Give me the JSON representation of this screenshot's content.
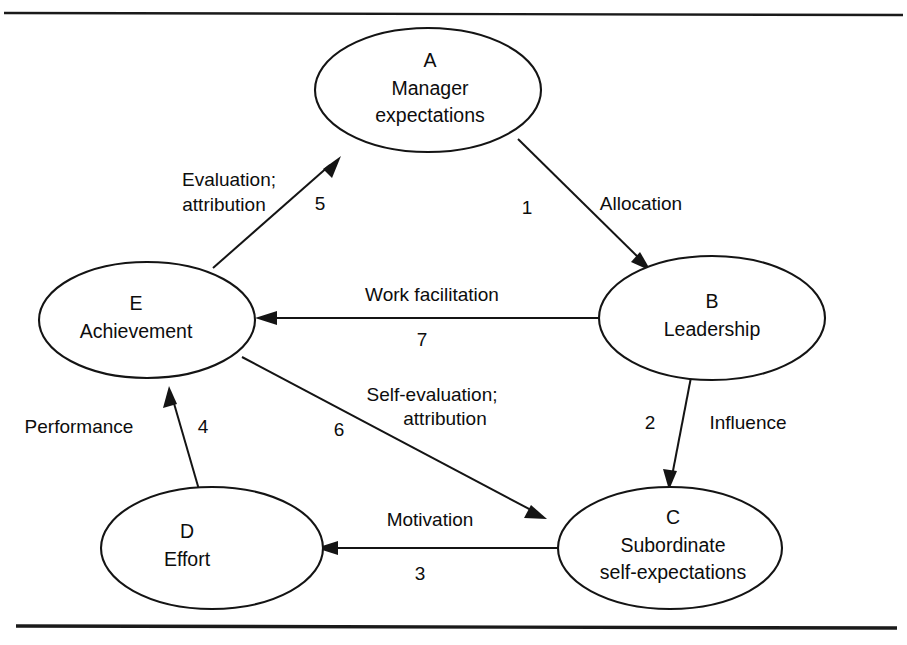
{
  "figure": {
    "background_color": "#ffffff",
    "line_color": "#141414",
    "text_color": "#0d0d0d"
  },
  "rules": {
    "top_label": "top-rule",
    "bottom_label": "bottom-rule"
  },
  "nodes": [
    {
      "id": "A",
      "letter": "A",
      "line1": "Manager",
      "line2": "expectations"
    },
    {
      "id": "B",
      "letter": "B",
      "line1": "Leadership",
      "line2": ""
    },
    {
      "id": "C",
      "letter": "C",
      "line1": "Subordinate",
      "line2": "self-expectations"
    },
    {
      "id": "D",
      "letter": "D",
      "line1": "Effort",
      "line2": ""
    },
    {
      "id": "E",
      "letter": "E",
      "line1": "Achievement",
      "line2": ""
    }
  ],
  "edges": [
    {
      "id": "edge-1",
      "number": "1",
      "label_line1": "Allocation",
      "label_line2": "",
      "from": "A",
      "to": "B"
    },
    {
      "id": "edge-2",
      "number": "2",
      "label_line1": "Influence",
      "label_line2": "",
      "from": "B",
      "to": "C"
    },
    {
      "id": "edge-3",
      "number": "3",
      "label_line1": "Motivation",
      "label_line2": "",
      "from": "C",
      "to": "D"
    },
    {
      "id": "edge-4",
      "number": "4",
      "label_line1": "Performance",
      "label_line2": "",
      "from": "D",
      "to": "E"
    },
    {
      "id": "edge-5",
      "number": "5",
      "label_line1": "Evaluation;",
      "label_line2": "attribution",
      "from": "E",
      "to": "A"
    },
    {
      "id": "edge-6",
      "number": "6",
      "label_line1": "Self-evaluation;",
      "label_line2": "attribution",
      "from": "E",
      "to": "C"
    },
    {
      "id": "edge-7",
      "number": "7",
      "label_line1": "Work facilitation",
      "label_line2": "",
      "from": "B",
      "to": "E"
    }
  ]
}
